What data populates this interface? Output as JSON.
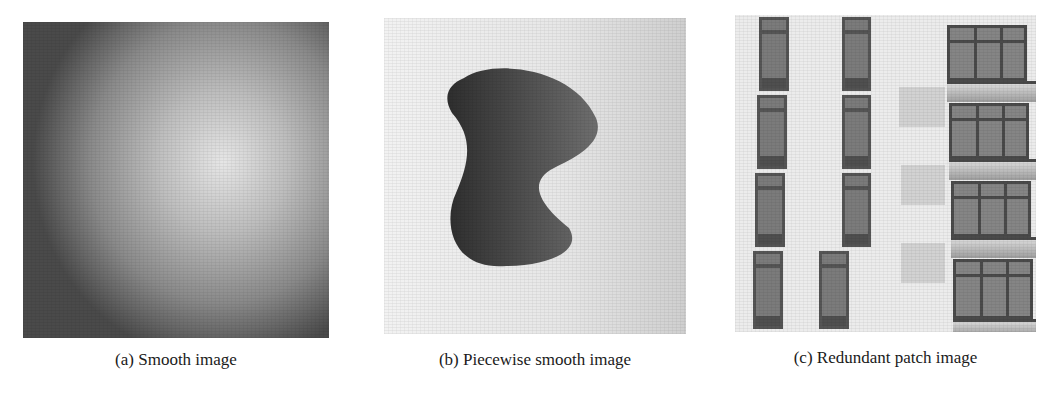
{
  "figure": {
    "panels": [
      {
        "id": "a",
        "caption": "(a) Smooth image",
        "content": "radial grayscale gradient with noise, bright center"
      },
      {
        "id": "b",
        "caption": "(b) Piecewise smooth image",
        "content": "dark blob shape on light gradient background with noise"
      },
      {
        "id": "c",
        "caption": "(c) Redundant patch image",
        "content": "building facade with repeated windows and balconies, grayscale"
      }
    ]
  }
}
